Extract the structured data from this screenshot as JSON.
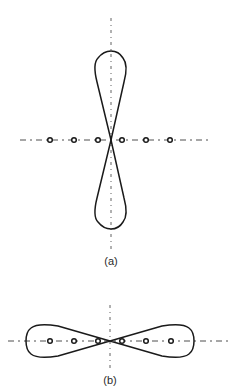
{
  "figure": {
    "panels": [
      {
        "id": "a",
        "label": "(a)",
        "description": "Vertical figure-eight (broadside) radiation pattern of a six-element linear array",
        "elements_count": 6,
        "orientation": "vertical lobes"
      },
      {
        "id": "b",
        "label": "(b)",
        "description": "Horizontal figure-eight (end-fire) radiation pattern of a six-element linear array",
        "elements_count": 6,
        "orientation": "horizontal lobes"
      }
    ]
  },
  "colors": {
    "line": "#1a1a1a",
    "axis": "#3a3a3a",
    "background": "#ffffff"
  }
}
